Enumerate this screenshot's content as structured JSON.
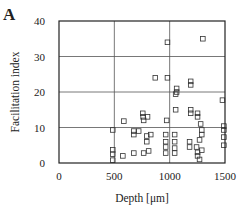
{
  "panel_label": "A",
  "chart_data": {
    "type": "scatter",
    "title": "",
    "xlabel": "Depth [μm]",
    "ylabel": "Facilitation index",
    "xlim": [
      0,
      1500
    ],
    "ylim": [
      0,
      40
    ],
    "xticks": [
      0,
      500,
      1000,
      1500
    ],
    "yticks": [
      0,
      10,
      20,
      30,
      40
    ],
    "grid": true,
    "marker": "open-square",
    "series": [
      {
        "name": "cells",
        "points": [
          [
            980,
            34
          ],
          [
            1300,
            35
          ],
          [
            870,
            24
          ],
          [
            980,
            24
          ],
          [
            1190,
            23
          ],
          [
            1190,
            22
          ],
          [
            1063,
            21
          ],
          [
            1063,
            20
          ],
          [
            1054,
            19.4
          ],
          [
            1477,
            17.7
          ],
          [
            757,
            14
          ],
          [
            760,
            13
          ],
          [
            800,
            13
          ],
          [
            1054,
            15
          ],
          [
            1190,
            15
          ],
          [
            1190,
            14
          ],
          [
            1252,
            14
          ],
          [
            1252,
            13
          ],
          [
            765,
            12
          ],
          [
            973,
            12
          ],
          [
            586,
            11.8
          ],
          [
            1280,
            11
          ],
          [
            1490,
            10.4
          ],
          [
            486,
            9.3
          ],
          [
            676,
            9
          ],
          [
            720,
            9
          ],
          [
            676,
            8
          ],
          [
            829,
            8
          ],
          [
            793,
            7.6
          ],
          [
            1290,
            9.3
          ],
          [
            1290,
            8
          ],
          [
            1490,
            9.3
          ],
          [
            964,
            8
          ],
          [
            1045,
            8
          ],
          [
            1490,
            7.3
          ],
          [
            1270,
            6.5
          ],
          [
            793,
            6
          ],
          [
            964,
            6
          ],
          [
            1045,
            6
          ],
          [
            1180,
            6
          ],
          [
            1490,
            5
          ],
          [
            964,
            4.5
          ],
          [
            1045,
            4.2
          ],
          [
            1180,
            4.5
          ],
          [
            1243,
            4.5
          ],
          [
            486,
            3.7
          ],
          [
            810,
            3.4
          ],
          [
            1290,
            3.6
          ],
          [
            676,
            2.8
          ],
          [
            765,
            2.8
          ],
          [
            964,
            2.8
          ],
          [
            1045,
            2.8
          ],
          [
            1252,
            3
          ],
          [
            486,
            2.5
          ],
          [
            577,
            2
          ],
          [
            1252,
            2
          ],
          [
            486,
            0.8
          ],
          [
            1270,
            1
          ]
        ]
      }
    ]
  }
}
